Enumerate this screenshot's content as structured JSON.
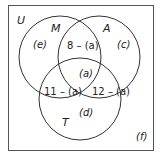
{
  "diagram": {
    "type": "venn-3-set",
    "universe_label": "U",
    "sets": [
      {
        "name": "M",
        "label": "M"
      },
      {
        "name": "A",
        "label": "A"
      },
      {
        "name": "T",
        "label": "T"
      }
    ],
    "regions": {
      "m_only": "(e)",
      "a_only": "(c)",
      "t_only": "(d)",
      "m_and_a_only": "8 – (a)",
      "m_and_t_only": "11 – (a)",
      "a_and_t_only": "12 – (a)",
      "all_three": "(a)",
      "outside": "(f)"
    },
    "colors": {
      "stroke": "#333333",
      "frame": "#555555",
      "text": "#222222",
      "background": "#ffffff"
    }
  }
}
